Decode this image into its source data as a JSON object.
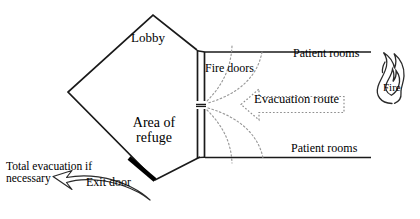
{
  "diagram": {
    "labels": {
      "lobby": "Lobby",
      "area_of_refuge": "Area of\nrefuge",
      "fire_doors": "Fire doors",
      "patient_rooms_top": "Patient rooms",
      "patient_rooms_bottom": "Patient rooms",
      "evacuation_route": "Evacuation route",
      "fire": "Fire",
      "total_evacuation": "Total evacuation if necessary",
      "exit_door": "Exit door"
    },
    "colors": {
      "stroke": "#1a1a1a",
      "background": "#ffffff",
      "dotted": "#8a8a8a",
      "door_fill": "#000000"
    }
  }
}
